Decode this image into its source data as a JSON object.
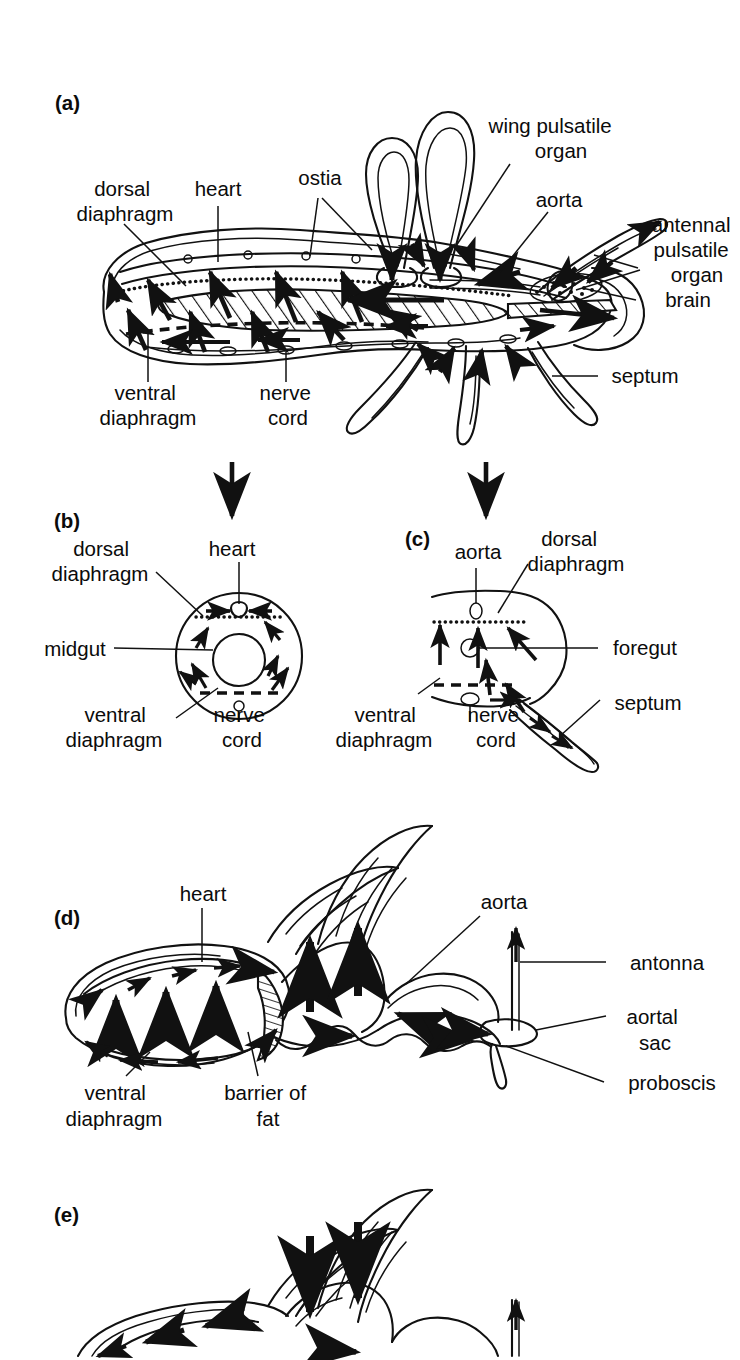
{
  "figure": {
    "background": "#ffffff",
    "ink_color": "#111111"
  },
  "panels": [
    {
      "id": "a",
      "id_label": "(a)",
      "caption": "Sagittal section of a generalized insect showing haemolymph circulation",
      "labels": [
        {
          "name": "dorsal-diaphragm",
          "text_lines": [
            "dorsal",
            "diaphragm"
          ],
          "x": 62,
          "y": 196
        },
        {
          "name": "heart",
          "text_lines": [
            "heart"
          ],
          "x": 196,
          "y": 196
        },
        {
          "name": "ostia",
          "text_lines": [
            "ostia"
          ],
          "x": 298,
          "y": 185
        },
        {
          "name": "wing-pulsatile-organ",
          "text_lines": [
            "wing pulsatile",
            "organ"
          ],
          "x": 481,
          "y": 130
        },
        {
          "name": "aorta",
          "text_lines": [
            "aorta"
          ],
          "x": 528,
          "y": 199
        },
        {
          "name": "antennal-pulsatile-organ",
          "text_lines": [
            "antennal",
            "pulsatile",
            "organ"
          ],
          "x": 650,
          "y": 226
        },
        {
          "name": "brain",
          "text_lines": [
            "brain"
          ],
          "x": 644,
          "y": 303
        },
        {
          "name": "septum",
          "text_lines": [
            "septum"
          ],
          "x": 608,
          "y": 381
        },
        {
          "name": "ventral-diaphragm",
          "text_lines": [
            "ventral",
            "diaphragm"
          ],
          "x": 108,
          "y": 400
        },
        {
          "name": "nerve-cord",
          "text_lines": [
            "nerve",
            "cord"
          ],
          "x": 249,
          "y": 400
        }
      ]
    },
    {
      "id": "b",
      "id_label": "(b)",
      "caption": "Abdominal cross-section showing dorsal and ventral diaphragms around the midgut",
      "labels": [
        {
          "name": "dorsal-diaphragm",
          "text_lines": [
            "dorsal",
            "diaphragm"
          ],
          "x": 63,
          "y": 550
        },
        {
          "name": "heart",
          "text_lines": [
            "heart"
          ],
          "x": 211,
          "y": 550
        },
        {
          "name": "midgut",
          "text_lines": [
            "midgut"
          ],
          "x": 40,
          "y": 648
        },
        {
          "name": "ventral-diaphragm",
          "text_lines": [
            "ventral",
            "diaphragm"
          ],
          "x": 62,
          "y": 712
        },
        {
          "name": "nerve-cord",
          "text_lines": [
            "nerve",
            "cord"
          ],
          "x": 213,
          "y": 712
        }
      ]
    },
    {
      "id": "c",
      "id_label": "(c)",
      "caption": "Thoracic cross-section showing aorta, foregut, septum and a leg",
      "labels": [
        {
          "name": "aorta",
          "text_lines": [
            "aorta"
          ],
          "x": 450,
          "y": 552
        },
        {
          "name": "dorsal-diaphragm",
          "text_lines": [
            "dorsal",
            "diaphragm"
          ],
          "x": 528,
          "y": 540
        },
        {
          "name": "foregut",
          "text_lines": [
            "foregut"
          ],
          "x": 608,
          "y": 646
        },
        {
          "name": "septum",
          "text_lines": [
            "septum"
          ],
          "x": 612,
          "y": 706
        },
        {
          "name": "ventral-diaphragm",
          "text_lines": [
            "ventral",
            "diaphragm"
          ],
          "x": 383,
          "y": 712
        },
        {
          "name": "nerve-cord",
          "text_lines": [
            "nerve",
            "cord"
          ],
          "x": 494,
          "y": 712
        }
      ]
    },
    {
      "id": "d",
      "id_label": "(d)",
      "caption": "Lateral view of the head and thorax with haemolymph flow during one phase",
      "labels": [
        {
          "name": "heart",
          "text_lines": [
            "heart"
          ],
          "x": 156,
          "y": 898
        },
        {
          "name": "aorta",
          "text_lines": [
            "aorta"
          ],
          "x": 444,
          "y": 903
        },
        {
          "name": "antonna",
          "text_lines": [
            "antonna"
          ],
          "x": 618,
          "y": 964
        },
        {
          "name": "aortal-sac",
          "text_lines": [
            "aortal",
            "sac"
          ],
          "x": 618,
          "y": 1020
        },
        {
          "name": "proboscis",
          "text_lines": [
            "proboscis"
          ],
          "x": 618,
          "y": 1084
        },
        {
          "name": "ventral-diaphragm",
          "text_lines": [
            "ventral",
            "diaphragm"
          ],
          "x": 76,
          "y": 1094
        },
        {
          "name": "barrier-of-fat",
          "text_lines": [
            "barrier of",
            "fat"
          ],
          "x": 212,
          "y": 1094
        }
      ]
    },
    {
      "id": "e",
      "id_label": "(e)",
      "caption": "Lateral view of the head and thorax with haemolymph flow reversed (image cropped at page edge)",
      "labels": []
    }
  ],
  "connector_arrows": [
    {
      "name": "arrow-a-to-b",
      "from_panel": "a",
      "to_panel": "b",
      "x": 232,
      "y_start": 462,
      "y_end": 520
    },
    {
      "name": "arrow-a-to-c",
      "from_panel": "a",
      "to_panel": "c",
      "x": 483,
      "y_start": 462,
      "y_end": 520
    }
  ]
}
